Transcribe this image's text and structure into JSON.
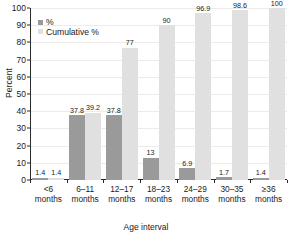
{
  "chart_data": {
    "type": "bar",
    "title": "",
    "xlabel": "Age interval",
    "ylabel": "Percent",
    "ylim": [
      0,
      100
    ],
    "ytick_step": 10,
    "yticks": [
      0,
      10,
      20,
      30,
      40,
      50,
      60,
      70,
      80,
      90,
      100
    ],
    "grid": true,
    "legend_position": "top-left-inside",
    "categories": [
      "<6\nmonths",
      "6–11\nmonths",
      "12–17\nmonths",
      "18–23\nmonths",
      "24–29\nmonths",
      "30–35\nmonths",
      "≥36\nmonths"
    ],
    "category_lines": [
      [
        "<6",
        "months"
      ],
      [
        "6–11",
        "months"
      ],
      [
        "12–17",
        "months"
      ],
      [
        "18–23",
        "months"
      ],
      [
        "24–29",
        "months"
      ],
      [
        "30–35",
        "months"
      ],
      [
        "≥36",
        "months"
      ]
    ],
    "series": [
      {
        "name": "%",
        "color": "#9a9a9a",
        "values": [
          1.4,
          37.8,
          37.8,
          13,
          6.9,
          1.7,
          1.4
        ],
        "labels": [
          "1.4",
          "37.8",
          "37.8",
          "13",
          "6.9",
          "1.7",
          "1.4"
        ]
      },
      {
        "name": "Cumulative %",
        "color": "#e0e0e0",
        "values": [
          1.4,
          39.2,
          77,
          90,
          96.9,
          98.6,
          100
        ],
        "labels": [
          "1.4",
          "39.2",
          "77",
          "90",
          "96.9",
          "98.6",
          "100"
        ]
      }
    ]
  },
  "legend": {
    "items": [
      {
        "label": "%"
      },
      {
        "label": "Cumulative %"
      }
    ]
  }
}
